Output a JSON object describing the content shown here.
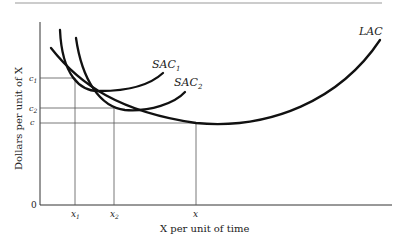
{
  "diagram": {
    "type": "cost-curves",
    "y_axis_label": "Dollars per unit of X",
    "x_axis_label": "X per unit of time",
    "origin_label": "0",
    "curves": [
      {
        "id": "SAC1",
        "label": "SAC",
        "subscript": "1"
      },
      {
        "id": "SAC2",
        "label": "SAC",
        "subscript": "2"
      },
      {
        "id": "LAC",
        "label": "LAC",
        "subscript": ""
      }
    ],
    "y_ticks": [
      {
        "id": "c1",
        "label": "c",
        "subscript": "1"
      },
      {
        "id": "c2",
        "label": "c",
        "subscript": "2"
      },
      {
        "id": "c",
        "label": "c",
        "subscript": ""
      }
    ],
    "x_ticks": [
      {
        "id": "x1",
        "label": "x",
        "subscript": "1"
      },
      {
        "id": "x2",
        "label": "x",
        "subscript": "2"
      },
      {
        "id": "x",
        "label": "x",
        "subscript": ""
      }
    ]
  },
  "colors": {
    "curve": "#111111",
    "guide": "#555555",
    "axis": "#333333",
    "rule": "#9a9a9a"
  }
}
